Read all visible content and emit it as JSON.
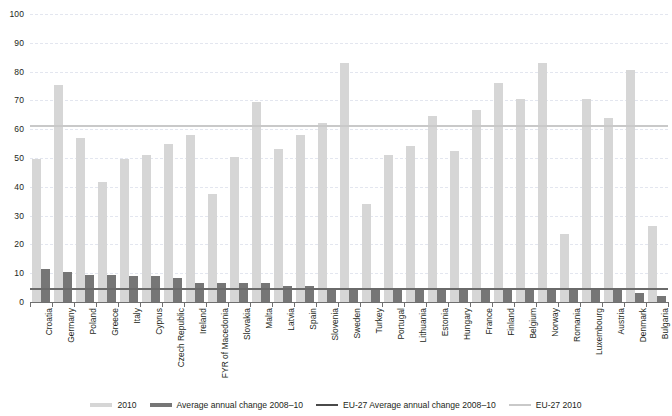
{
  "chart_data": {
    "type": "bar",
    "title": "",
    "xlabel": "",
    "ylabel": "",
    "ylim": [
      0,
      100
    ],
    "yticks": [
      0,
      10,
      20,
      30,
      40,
      50,
      60,
      70,
      80,
      90,
      100
    ],
    "grid": true,
    "legend_position": "bottom",
    "categories": [
      "Croatia",
      "Germany",
      "Poland",
      "Greece",
      "Italy",
      "Cyprus",
      "Czech Republic",
      "Ireland",
      "FYR of Macedonia",
      "Slovakia",
      "Malta",
      "Latvia",
      "Spain",
      "Slovenia",
      "Sweden",
      "Turkey",
      "Portugal",
      "Lithuania",
      "Estonia",
      "Hungary",
      "France",
      "Finland",
      "Belgium",
      "Norway",
      "Romania",
      "Luxembourg",
      "Austria",
      "Denmark",
      "Bulgaria"
    ],
    "series": [
      {
        "name": "2010",
        "color": "#d6d6d6",
        "values": [
          49.5,
          75.5,
          57.0,
          41.5,
          49.5,
          51.0,
          55.0,
          58.0,
          37.5,
          50.5,
          69.5,
          53.0,
          58.0,
          62.0,
          83.0,
          34.0,
          51.0,
          54.0,
          64.5,
          52.5,
          66.5,
          76.0,
          70.5,
          83.0,
          23.5,
          70.5,
          64.0,
          80.5,
          26.5
        ]
      },
      {
        "name": "Average annual change 2008–10",
        "color": "#767676",
        "values": [
          11.5,
          10.5,
          9.5,
          9.5,
          9.0,
          9.0,
          8.5,
          6.5,
          6.5,
          6.5,
          6.5,
          5.5,
          5.5,
          5.0,
          5.0,
          5.0,
          5.0,
          5.0,
          5.0,
          4.0,
          4.0,
          4.0,
          4.0,
          4.0,
          4.0,
          4.0,
          4.0,
          3.0,
          2.0
        ]
      }
    ],
    "reference_lines": [
      {
        "name": "EU-27 2010",
        "value": 61,
        "color": "#c9c9c9"
      },
      {
        "name": "EU-27 Average annual change 2008–10",
        "value": 4.5,
        "color": "#6a6a6a"
      }
    ],
    "legend": [
      {
        "label": "2010",
        "color": "#d6d6d6",
        "style": "bar"
      },
      {
        "label": "Average annual change 2008–10",
        "color": "#767676",
        "style": "bar"
      },
      {
        "label": "EU-27 Average annual change 2008–10",
        "color": "#4a4a4a",
        "style": "line"
      },
      {
        "label": "EU-27 2010",
        "color": "#c9c9c9",
        "style": "line"
      }
    ]
  }
}
